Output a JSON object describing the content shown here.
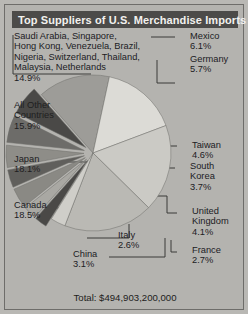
{
  "figure": {
    "title": "Top Suppliers of U.S. Merchandise Imports",
    "total_label": "Total: $494,903,200,000"
  },
  "chart_data": {
    "type": "pie",
    "title": "Top Suppliers of U.S. Merchandise Imports",
    "total": "Total: $494,903,200,000",
    "total_value": 494903200000,
    "units": "percent of total U.S. merchandise imports",
    "legend": "labels with leader lines around pie",
    "categories": [
      "Canada",
      "Japan",
      "All Other Countries",
      "Saudi Arabia, Singapore, Hong Kong, Venezuela, Brazil, Nigeria, Switzerland, Thailand, Malaysia, Netherlands",
      "Mexico",
      "Germany",
      "Taiwan",
      "South Korea",
      "United Kingdom",
      "France",
      "Italy",
      "China"
    ],
    "values": [
      18.5,
      18.1,
      15.9,
      14.9,
      6.1,
      5.7,
      4.6,
      3.7,
      4.1,
      2.7,
      2.6,
      3.1
    ],
    "slices": [
      {
        "name": "Saudi Arabia, Singapore, Hong Kong, Venezuela, Brazil, Nigeria, Switzerland, Thailand, Malaysia, Netherlands",
        "value": 14.9,
        "label": "14.9%",
        "color": "#9d9c98",
        "exploded": false
      },
      {
        "name": "All Other Countries",
        "value": 15.9,
        "label": "15.9%",
        "color": "#dcdbd6",
        "exploded": false
      },
      {
        "name": "Japan",
        "value": 18.1,
        "label": "18.1%",
        "color": "#cbcac5",
        "exploded": false
      },
      {
        "name": "Canada",
        "value": 18.5,
        "label": "18.5%",
        "color": "#bab9b4",
        "exploded": false
      },
      {
        "name": "China",
        "value": 3.1,
        "label": "3.1%",
        "color": "#cfcec9",
        "exploded": false
      },
      {
        "name": "Italy",
        "value": 2.6,
        "label": "2.6%",
        "color": "#4a4947",
        "exploded": true
      },
      {
        "name": "France",
        "value": 2.7,
        "label": "2.7%",
        "color": "#a9a8a3",
        "exploded": true
      },
      {
        "name": "United Kingdom",
        "value": 4.1,
        "label": "4.1%",
        "color": "#8a8984",
        "exploded": true
      },
      {
        "name": "South Korea",
        "value": 3.7,
        "label": "3.7%",
        "color": "#605f5c",
        "exploded": true
      },
      {
        "name": "Taiwan",
        "value": 4.6,
        "label": "4.6%",
        "color": "#8e8d88",
        "exploded": true
      },
      {
        "name": "Germany",
        "value": 5.7,
        "label": "5.7%",
        "color": "#6d6c69",
        "exploded": true
      },
      {
        "name": "Mexico",
        "value": 6.1,
        "label": "6.1%",
        "color": "#4a4947",
        "exploded": true
      }
    ]
  },
  "labels": {
    "group_other_named": "Saudi Arabia, Singapore,\nHong Kong, Venezuela, Brazil,\nNigeria, Switzerland, Thailand,\nMalaysia, Netherlands\n14.9%",
    "all_other": "All Other\nCountries\n15.9%",
    "japan": "Japan\n18.1%",
    "canada": "Canada\n18.5%",
    "china": "China\n3.1%",
    "italy": "Italy\n2.6%",
    "mexico": "Mexico\n6.1%",
    "germany": "Germany\n5.7%",
    "taiwan": "Taiwan\n4.6%",
    "south_korea": "South\nKorea\n3.7%",
    "united_kingdom": "United\nKingdom\n4.1%",
    "france": "France\n2.7%"
  }
}
